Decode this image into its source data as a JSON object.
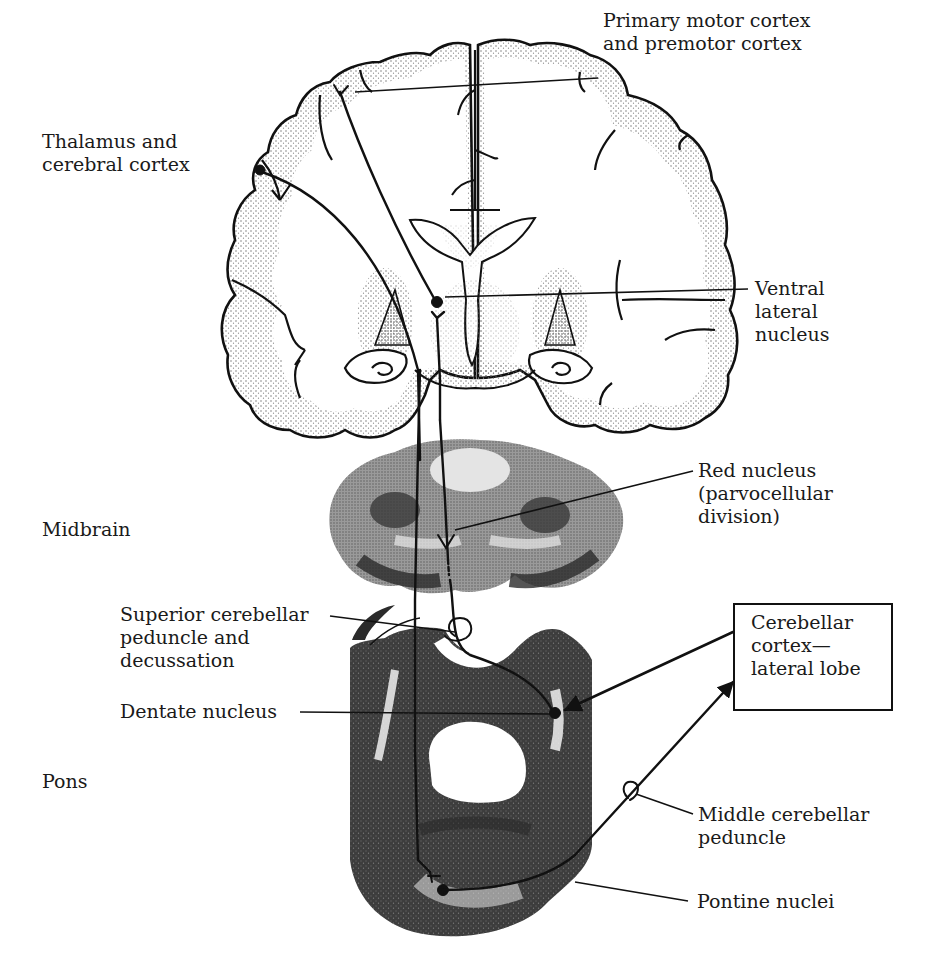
{
  "figure": {
    "type": "neuroanatomy pathway diagram"
  },
  "labels": {
    "primary_motor": "Primary motor cortex\nand premotor cortex",
    "thalamus_cortex": "Thalamus and\ncerebral cortex",
    "ventral_lateral": "Ventral\nlateral\nnucleus",
    "red_nucleus": "Red nucleus\n(parvocellular\ndivision)",
    "midbrain": "Midbrain",
    "superior_cerebellar": "Superior cerebellar\npeduncle and\ndecussation",
    "dentate": "Dentate nucleus",
    "cerebellar_cortex_box": "Cerebellar\ncortex—\nlateral lobe",
    "pons": "Pons",
    "middle_cerebellar": "Middle cerebellar\npeduncle",
    "pontine_nuclei": "Pontine nuclei"
  },
  "colors": {
    "ink": "#111111",
    "stipple": "#7a7a7a",
    "tissue_dark": "#3a3a3a",
    "tissue_mid": "#8c8c8c",
    "background": "#ffffff"
  }
}
